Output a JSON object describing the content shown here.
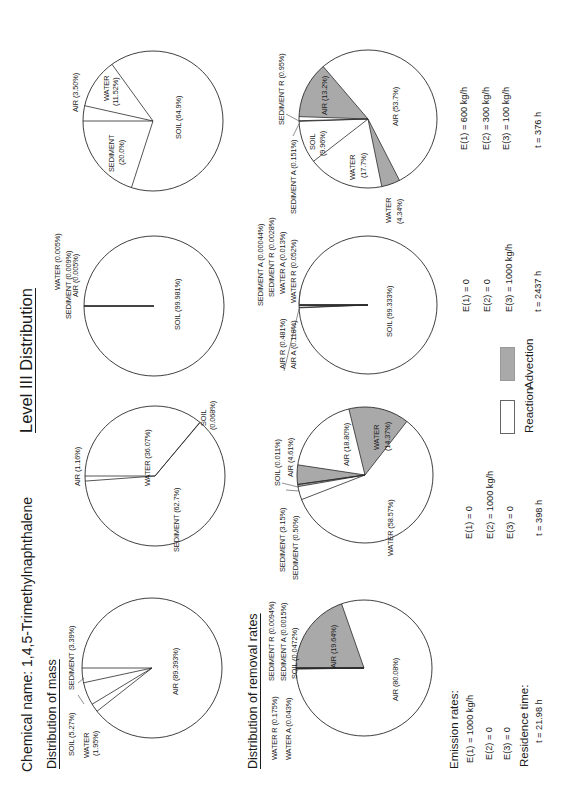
{
  "header": {
    "chemical_name": "Chemical name: 1,4,5-Trimethylnaphthalene",
    "title": "Level III Distribution"
  },
  "sections": {
    "mass": "Distribution of mass",
    "removal": "Distribution of removal rates",
    "emission_rates": "Emission rates:",
    "residence_time": "Residence time:"
  },
  "legend": {
    "reaction": "Reaction",
    "advection": "Advection",
    "reaction_color": "#ffffff",
    "advection_color": "#a9a9a9"
  },
  "colors": {
    "reaction": "#ffffff",
    "advection": "#a9a9a9",
    "stroke": "#2a2a2a"
  },
  "scenarios": [
    {
      "emissions": [
        "E(1) = 1000 kg/h",
        "E(2) = 0",
        "E(3) = 0"
      ],
      "residence": "t = 21.98 h",
      "mass_labels": [
        "SOIL (5.27%)",
        "WATER",
        "(1.95%)",
        "SEDIMENT (3.39%)",
        "AIR (89.393%)"
      ],
      "removal_labels": [
        "WATER R (0.175%)",
        "WATER A (0.043%)",
        "SEDIMENT R (0.0094%)",
        "SEDIMENT A (0.0015%)",
        "SOIL (0.0472%)",
        "AIR (19.64%)",
        "AIR (80.08%)"
      ]
    },
    {
      "emissions": [
        "E(1) = 0",
        "E(2) = 1000 kg/h",
        "E(3) = 0"
      ],
      "residence": "t = 398 h",
      "mass_labels": [
        "AIR (1.16%)",
        "WATER (36.07%)",
        "SEDIMENT (62.7%)",
        "SOIL",
        "(0.068%)"
      ],
      "removal_labels": [
        "SEDIMENT (3.15%)",
        "SEDIMENT (0.50%)",
        "SOIL (0.011%)",
        "AIR (4.61%)",
        "AIR (18.80%)",
        "WATER",
        "(14.37%)",
        "WATER (58.57%)"
      ]
    },
    {
      "emissions": [
        "E(1) = 0",
        "E(2) = 0",
        "E(3) = 1000 kg/h"
      ],
      "residence": "t = 2437 h",
      "mass_labels": [
        "WATER (0.005%)",
        "SEDIMENT (0.009%)",
        "AIR (0.005%)",
        "SOIL (99.981%)"
      ],
      "removal_labels": [
        "SEDIMENT A (0.00044%)",
        "SEDIMENT R (0.0028%)",
        "WATER A (0.013%)",
        "WATER R (0.052%)",
        "AIR R (0.481%)",
        "AIR A (0.118%)",
        "SOIL (99.333%)"
      ]
    },
    {
      "emissions": [
        "E(1) = 600 kg/h",
        "E(2) = 300 kg/h",
        "E(3) = 100 kg/h"
      ],
      "residence": "t = 376 h",
      "mass_labels": [
        "AIR (3.50%)",
        "WATER",
        "(11.52%)",
        "SEDIMENT",
        "(20.0%)",
        "SOIL (64.9%)"
      ],
      "removal_labels": [
        "SEDIMENT R (0.95%)",
        "SEDIMENT A (0.151%)",
        "AIR (13.2%)",
        "SOIL",
        "(9.96%)",
        "WATER",
        "(17.7%)",
        "AIR (53.7%)",
        "WATER",
        "(4.34%)"
      ]
    }
  ],
  "chart_data": [
    {
      "type": "pie",
      "title": "Distribution of mass",
      "scenario": "E(1)=1000 kg/h, E(2)=0, E(3)=0",
      "center": [
        123,
        152
      ],
      "radius": 70,
      "start_angle": 0,
      "slices": [
        {
          "name": "AIR",
          "value": 89.393,
          "kind": "reaction"
        },
        {
          "name": "WATER",
          "value": 1.95,
          "kind": "reaction"
        },
        {
          "name": "SOIL",
          "value": 5.27,
          "kind": "reaction"
        },
        {
          "name": "SEDIMENT",
          "value": 3.39,
          "kind": "reaction"
        }
      ]
    },
    {
      "type": "pie",
      "title": "Distribution of removal rates",
      "scenario": "E(1)=1000 kg/h, E(2)=0, E(3)=0",
      "center": [
        123,
        364
      ],
      "radius": 68,
      "start_angle": 0,
      "slices": [
        {
          "name": "AIR A",
          "value": 19.64,
          "kind": "advection"
        },
        {
          "name": "AIR R",
          "value": 80.08,
          "kind": "reaction"
        },
        {
          "name": "WATER R",
          "value": 0.175,
          "kind": "reaction"
        },
        {
          "name": "WATER A",
          "value": 0.043,
          "kind": "advection"
        },
        {
          "name": "SOIL",
          "value": 0.0472,
          "kind": "reaction"
        },
        {
          "name": "SEDIMENT R",
          "value": 0.0094,
          "kind": "reaction"
        },
        {
          "name": "SEDIMENT A",
          "value": 0.0015,
          "kind": "advection"
        }
      ]
    },
    {
      "type": "pie",
      "title": "Distribution of mass",
      "scenario": "E(1)=0, E(2)=1000 kg/h, E(3)=0",
      "center": [
        315,
        155
      ],
      "radius": 70,
      "start_angle": 0,
      "slices": [
        {
          "name": "WATER",
          "value": 36.07,
          "kind": "reaction"
        },
        {
          "name": "SOIL",
          "value": 0.068,
          "kind": "reaction"
        },
        {
          "name": "SEDIMENT",
          "value": 62.7,
          "kind": "reaction"
        },
        {
          "name": "AIR",
          "value": 1.16,
          "kind": "reaction"
        }
      ]
    },
    {
      "type": "pie",
      "title": "Distribution of removal rates",
      "scenario": "E(1)=0, E(2)=1000 kg/h, E(3)=0",
      "center": [
        316,
        365
      ],
      "radius": 68,
      "start_angle": -8,
      "slices": [
        {
          "name": "AIR A",
          "value": 4.61,
          "kind": "advection"
        },
        {
          "name": "AIR R",
          "value": 18.8,
          "kind": "reaction"
        },
        {
          "name": "WATER A",
          "value": 14.37,
          "kind": "advection"
        },
        {
          "name": "WATER R",
          "value": 58.57,
          "kind": "reaction"
        },
        {
          "name": "SEDIMENT R",
          "value": 3.15,
          "kind": "reaction"
        },
        {
          "name": "SEDIMENT A",
          "value": 0.5,
          "kind": "advection"
        },
        {
          "name": "SOIL",
          "value": 0.011,
          "kind": "reaction"
        }
      ]
    },
    {
      "type": "pie",
      "title": "Distribution of mass",
      "scenario": "E(1)=0, E(2)=0, E(3)=1000 kg/h",
      "center": [
        485,
        154
      ],
      "radius": 70,
      "start_angle": 0,
      "slices": [
        {
          "name": "SOIL",
          "value": 99.981,
          "kind": "reaction"
        },
        {
          "name": "SEDIMENT",
          "value": 0.009,
          "kind": "reaction"
        },
        {
          "name": "AIR",
          "value": 0.005,
          "kind": "reaction"
        },
        {
          "name": "WATER",
          "value": 0.005,
          "kind": "reaction"
        }
      ]
    },
    {
      "type": "pie",
      "title": "Distribution of removal rates",
      "scenario": "E(1)=0, E(2)=0, E(3)=1000 kg/h",
      "center": [
        486,
        368
      ],
      "radius": 69,
      "start_angle": 0,
      "slices": [
        {
          "name": "SOIL",
          "value": 99.333,
          "kind": "reaction"
        },
        {
          "name": "AIR A",
          "value": 0.118,
          "kind": "advection"
        },
        {
          "name": "AIR R",
          "value": 0.481,
          "kind": "reaction"
        },
        {
          "name": "WATER R",
          "value": 0.052,
          "kind": "reaction"
        },
        {
          "name": "WATER A",
          "value": 0.013,
          "kind": "advection"
        },
        {
          "name": "SEDIMENT R",
          "value": 0.0028,
          "kind": "reaction"
        },
        {
          "name": "SEDIMENT A",
          "value": 0.00044,
          "kind": "advection"
        }
      ]
    },
    {
      "type": "pie",
      "title": "Distribution of mass",
      "scenario": "E(1)=600 kg/h, E(2)=300 kg/h, E(3)=100 kg/h",
      "center": [
        670,
        153
      ],
      "radius": 70,
      "start_angle": 0,
      "slices": [
        {
          "name": "AIR",
          "value": 3.5,
          "kind": "reaction"
        },
        {
          "name": "WATER",
          "value": 11.52,
          "kind": "reaction"
        },
        {
          "name": "SOIL",
          "value": 64.9,
          "kind": "reaction"
        },
        {
          "name": "SEDIMENT",
          "value": 20.0,
          "kind": "reaction"
        }
      ]
    },
    {
      "type": "pie",
      "title": "Distribution of removal rates",
      "scenario": "E(1)=600 kg/h, E(2)=300 kg/h, E(3)=100 kg/h",
      "center": [
        672,
        368
      ],
      "radius": 69,
      "start_angle": 2,
      "slices": [
        {
          "name": "AIR A",
          "value": 13.2,
          "kind": "advection"
        },
        {
          "name": "AIR R",
          "value": 53.7,
          "kind": "reaction"
        },
        {
          "name": "WATER A",
          "value": 4.34,
          "kind": "advection"
        },
        {
          "name": "WATER R",
          "value": 17.7,
          "kind": "reaction"
        },
        {
          "name": "SOIL",
          "value": 9.96,
          "kind": "reaction"
        },
        {
          "name": "SEDIMENT A",
          "value": 0.151,
          "kind": "advection"
        },
        {
          "name": "SEDIMENT R",
          "value": 0.95,
          "kind": "reaction"
        }
      ]
    }
  ]
}
